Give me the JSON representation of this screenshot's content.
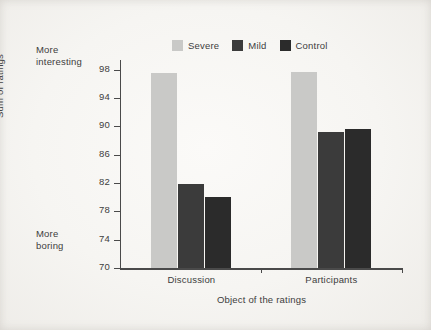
{
  "chart_data": {
    "type": "bar",
    "title": "",
    "subtitle": "",
    "xlabel": "Object of the ratings",
    "ylabel": "Sum of ratings",
    "categories": [
      "Discussion",
      "Participants"
    ],
    "series": [
      {
        "name": "Severe",
        "color": "#c9c9c7",
        "values": [
          97.6,
          97.7
        ]
      },
      {
        "name": "Mild",
        "color": "#3b3b3b",
        "values": [
          81.8,
          89.2
        ]
      },
      {
        "name": "Control",
        "color": "#2b2b2b",
        "values": [
          80.1,
          89.7
        ]
      }
    ],
    "ylim": [
      70,
      99.1
    ],
    "yticks": [
      70,
      74,
      78,
      82,
      86,
      90,
      94,
      98
    ],
    "ytick_labels": [
      "70",
      "74",
      "78",
      "82",
      "86",
      "90",
      "94",
      "98"
    ],
    "grid": false,
    "legend_position": "top-center",
    "annotations": [
      {
        "name": "more-interesting",
        "text_line1": "More",
        "text_line2": "interesting",
        "position": "top-left"
      },
      {
        "name": "more-boring",
        "text_line1": "More",
        "text_line2": "boring",
        "position": "bottom-left"
      }
    ]
  },
  "axes": {
    "y_title": "Sum of ratings",
    "x_title": "Object of the ratings",
    "y_ticks": [
      "70",
      "74",
      "78",
      "82",
      "86",
      "90",
      "94",
      "98"
    ],
    "x_categories": [
      "Discussion",
      "Participants"
    ]
  },
  "legend": {
    "items": [
      {
        "label": "Severe",
        "color": "#c9c9c7"
      },
      {
        "label": "Mild",
        "color": "#3b3b3b"
      },
      {
        "label": "Control",
        "color": "#2b2b2b"
      }
    ]
  },
  "notes": {
    "top": {
      "line1": "More",
      "line2": "interesting"
    },
    "bottom": {
      "line1": "More",
      "line2": "boring"
    }
  },
  "colors": {
    "background": "#f6f5f2",
    "axis": "#4a4a4a",
    "text": "#3d3d3d"
  }
}
